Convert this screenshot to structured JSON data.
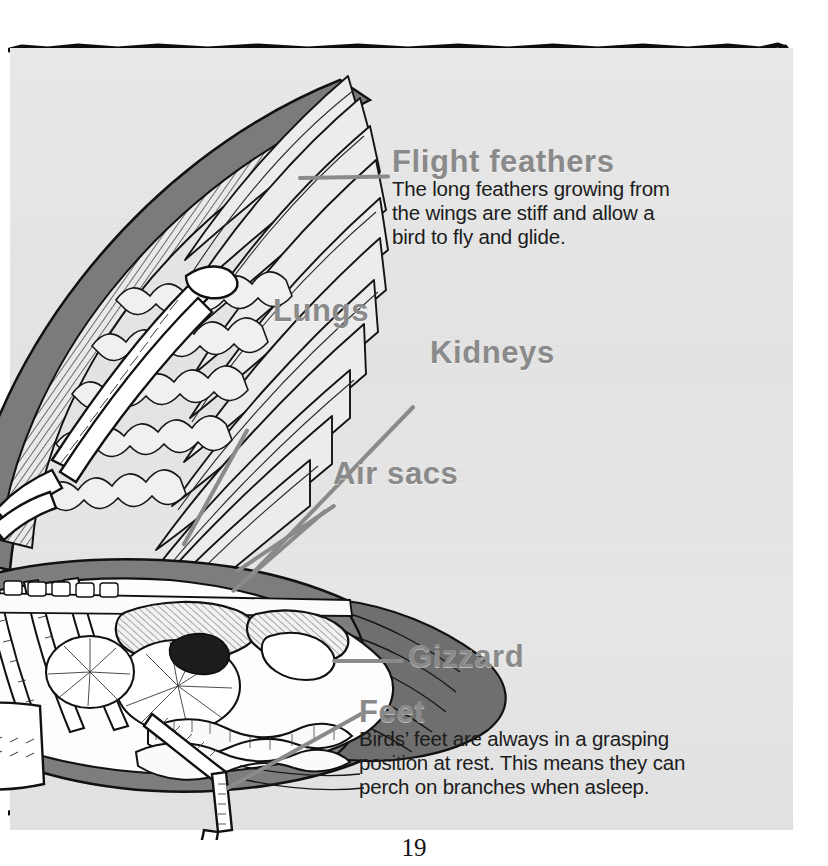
{
  "page": {
    "number": "19",
    "background_color": "#e5e5e5",
    "border_color": "#101010",
    "heading_color": "#8a8a8a",
    "body_color": "#1c1c1c",
    "leader_color": "#8a8a8a"
  },
  "illustration": {
    "name": "bird-anatomy-cutaway",
    "description": "Cutaway anatomical illustration of a bird showing the wing with flight feathers, skeleton, lungs, air sacs, kidneys, gizzard, intestines and a grasping foot"
  },
  "callouts": [
    {
      "id": "flight-feathers",
      "heading": "Flight feathers",
      "body": [
        "The long feathers growing from",
        "the wings are stiff and allow a",
        "bird to fly and glide."
      ]
    },
    {
      "id": "lungs",
      "heading": "Lungs",
      "body": []
    },
    {
      "id": "kidneys",
      "heading": "Kidneys",
      "body": []
    },
    {
      "id": "air-sacs",
      "heading": "Air sacs",
      "body": []
    },
    {
      "id": "gizzard",
      "heading": "Gizzard",
      "body": []
    },
    {
      "id": "feet",
      "heading": "Feet",
      "body": [
        "Birds’ feet are always in a grasping",
        "position at rest. This means they can",
        "perch on branches when asleep."
      ]
    }
  ]
}
